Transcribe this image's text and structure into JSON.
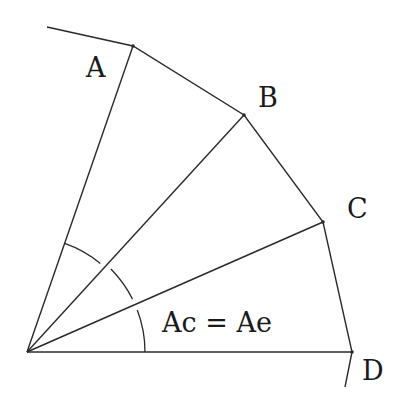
{
  "diagram": {
    "stroke_color": "#2a2a2a",
    "text_color": "#1a1a1a",
    "background": "#ffffff",
    "origin": {
      "x": 27,
      "y": 352
    },
    "points": [
      {
        "name": "A",
        "x": 133,
        "y": 46,
        "label": "A",
        "label_x": 86,
        "label_y": 77
      },
      {
        "name": "B",
        "x": 244,
        "y": 115,
        "label": "B",
        "label_x": 258,
        "label_y": 107
      },
      {
        "name": "C",
        "x": 323,
        "y": 222,
        "label": "C",
        "label_x": 347,
        "label_y": 218
      },
      {
        "name": "D",
        "x": 352,
        "y": 352,
        "label": "D",
        "label_x": 362,
        "label_y": 380
      }
    ],
    "boundary_start": {
      "x": 47,
      "y": 27
    },
    "boundary_end": {
      "x": 345,
      "y": 387
    },
    "arc_radius": 117,
    "equation_label": "Ac = Ae",
    "equation_x": 162,
    "equation_y": 332
  }
}
